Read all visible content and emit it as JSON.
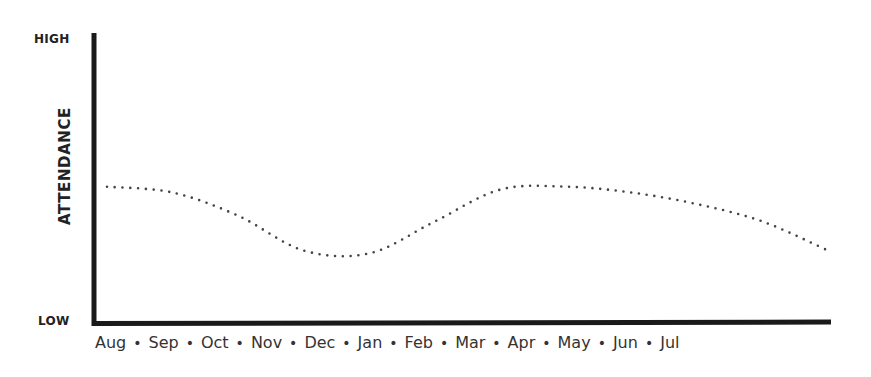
{
  "chart_data": {
    "type": "line",
    "title": "",
    "xlabel": "",
    "ylabel": "ATTENDANCE",
    "y_tick_labels": {
      "top": "HIGH",
      "bottom": "LOW"
    },
    "ylim": [
      0,
      100
    ],
    "grid": false,
    "legend": null,
    "line_style": "dotted",
    "categories": [
      "Aug",
      "Sep",
      "Oct",
      "Nov",
      "Dec",
      "Jan",
      "Feb",
      "Mar",
      "Apr",
      "May",
      "Jun",
      "Jul"
    ],
    "separator": "•",
    "series": [
      {
        "name": "Attendance",
        "values": [
          47,
          45,
          37,
          25,
          24,
          35,
          46,
          47,
          45,
          41,
          35,
          25
        ]
      }
    ]
  },
  "axis": {
    "y_high_label": "HIGH",
    "y_low_label": "LOW",
    "y_title": "ATTENDANCE"
  },
  "colors": {
    "axis": "#1a1a1a",
    "line": "#444444",
    "text": "#2b2b2b"
  }
}
